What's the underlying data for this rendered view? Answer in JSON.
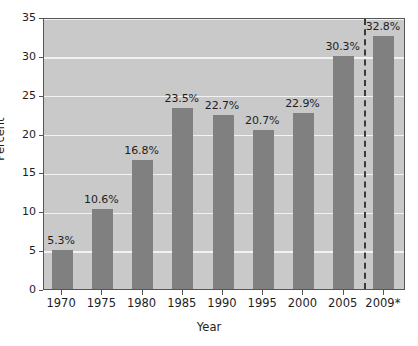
{
  "chart_data": {
    "type": "bar",
    "title": "",
    "subtitle": "",
    "xlabel": "Year",
    "ylabel": "Percent",
    "categories": [
      "1970",
      "1975",
      "1980",
      "1985",
      "1990",
      "1995",
      "2000",
      "2005",
      "2009*"
    ],
    "values": [
      5.3,
      10.6,
      16.8,
      23.5,
      22.7,
      20.7,
      22.9,
      30.3,
      32.8
    ],
    "value_labels": [
      "5.3%",
      "10.6%",
      "16.8%",
      "23.5%",
      "22.7%",
      "20.7%",
      "22.9%",
      "30.3%",
      "32.8%"
    ],
    "ylim": [
      0,
      35
    ],
    "ytick_labels": [
      "0",
      "5",
      "10",
      "15",
      "20",
      "25",
      "30",
      "35"
    ],
    "ytick_values": [
      0,
      5,
      10,
      15,
      20,
      25,
      30,
      35
    ],
    "grid": true,
    "grid_axis": "y",
    "legend": null,
    "legend_position": "none",
    "annotations": [
      {
        "name": "forecast-divider",
        "type": "vertical-dashed-line",
        "between_categories": [
          "2005",
          "2009*"
        ],
        "note": "2009* separated by dashed line"
      }
    ],
    "colors": {
      "bar": "#808080",
      "plot_background": "#c9c9c9",
      "gridline": "#f2f2f2",
      "axis": "#555555",
      "text": "#1e1e1e",
      "page_background": "#ffffff",
      "divider": "#3a3a3a"
    }
  }
}
